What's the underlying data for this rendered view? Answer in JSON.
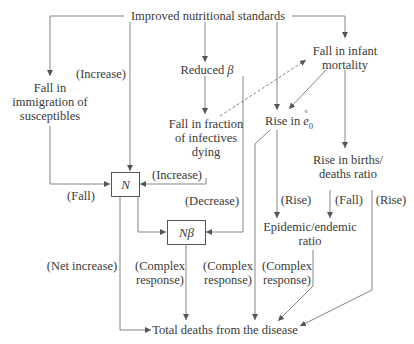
{
  "diagram": {
    "type": "flow-diagram",
    "root": "Improved nutritional standards",
    "nodes": {
      "improved_nutrition": "Improved nutritional standards",
      "fall_immigration": [
        "Fall in",
        "immigration of",
        "susceptibles"
      ],
      "reduced_beta": "Reduced β",
      "fall_infant_mortality": [
        "Fall in infant",
        "mortality"
      ],
      "fall_fraction_infectives": [
        "Fall in fraction",
        "of infectives",
        "dying"
      ],
      "rise_e0": "Rise in e̊₀",
      "rise_births_deaths": [
        "Rise in births/",
        "deaths ratio"
      ],
      "N": "N",
      "N_beta": "Nβ",
      "epidemic_endemic": [
        "Epidemic/endemic",
        "ratio"
      ],
      "total_deaths": "Total deaths from the disease"
    },
    "edge_labels": {
      "increase_to_N_top": "(Increase)",
      "fall_to_N": "(Fall)",
      "increase_to_N_right": "(Increase)",
      "decrease_to_Nbeta": "(Decrease)",
      "rise_to_epidemic": "(Rise)",
      "fall_to_epidemic": "(Fall)",
      "rise_to_total": "(Rise)",
      "net_increase": "(Net increase)",
      "complex_1": [
        "(Complex",
        "response)"
      ],
      "complex_2": [
        "(Complex",
        "response)"
      ],
      "complex_3": [
        "(Complex",
        "response)"
      ]
    },
    "edges": [
      {
        "from": "Improved nutritional standards",
        "to": "Fall in immigration of susceptibles"
      },
      {
        "from": "Improved nutritional standards",
        "to": "N",
        "label": "(Increase)"
      },
      {
        "from": "Improved nutritional standards",
        "to": "Reduced β"
      },
      {
        "from": "Improved nutritional standards",
        "to": "Rise in e̊₀"
      },
      {
        "from": "Improved nutritional standards",
        "to": "Fall in infant mortality"
      },
      {
        "from": "Reduced β",
        "to": "Fall in fraction of infectives dying"
      },
      {
        "from": "Fall in fraction of infectives dying",
        "to": "Fall in infant mortality",
        "style": "dashed"
      },
      {
        "from": "Fall in infant mortality",
        "to": "Rise in e̊₀"
      },
      {
        "from": "Fall in infant mortality",
        "to": "Rise in births/deaths ratio"
      },
      {
        "from": "Fall in immigration of susceptibles",
        "to": "N",
        "label": "(Fall)"
      },
      {
        "from": "Fall in fraction of infectives dying",
        "to": "N",
        "label": "(Increase)"
      },
      {
        "from": "Reduced β",
        "to": "Nβ",
        "label": "(Decrease)"
      },
      {
        "from": "N",
        "to": "Nβ"
      },
      {
        "from": "Rise in e̊₀",
        "to": "Epidemic/endemic ratio",
        "label": "(Rise)"
      },
      {
        "from": "Rise in births/deaths ratio",
        "to": "Epidemic/endemic ratio",
        "label": "(Fall)"
      },
      {
        "from": "N",
        "to": "Total deaths from the disease",
        "label": "(Net increase)"
      },
      {
        "from": "Nβ",
        "to": "Total deaths from the disease",
        "label": "(Complex response)"
      },
      {
        "from": "Rise in e̊₀",
        "to": "Total deaths from the disease",
        "label": "(Complex response)"
      },
      {
        "from": "Epidemic/endemic ratio",
        "to": "Total deaths from the disease",
        "label": "(Complex response)"
      },
      {
        "from": "Rise in births/deaths ratio",
        "to": "Total deaths from the disease",
        "label": "(Rise)"
      }
    ]
  },
  "labels": {
    "improved": "Improved nutritional standards",
    "fall_imm_1": "Fall in",
    "fall_imm_2": "immigration of",
    "fall_imm_3": "susceptibles",
    "reduced": "Reduced",
    "beta": "β",
    "infant_1": "Fall in infant",
    "infant_2": "mortality",
    "fraction_1": "Fall in fraction",
    "fraction_2": "of infectives",
    "fraction_3": "dying",
    "rise_in": "Rise in",
    "e0_symbol": "e",
    "e0_ring": "°",
    "e0_sub": "0",
    "births_1": "Rise in births/",
    "births_2": "deaths ratio",
    "N": "N",
    "Nbeta": "Nβ",
    "epi_1": "Epidemic/endemic",
    "epi_2": "ratio",
    "total": "Total deaths from the disease",
    "increase_top": "(Increase)",
    "fall_left": "(Fall)",
    "increase_right": "(Increase)",
    "decrease": "(Decrease)",
    "rise_a": "(Rise)",
    "fall_b": "(Fall)",
    "rise_c": "(Rise)",
    "net_increase": "(Net increase)",
    "complex_a1": "(Complex",
    "complex_a2": "response)",
    "complex_b1": "(Complex",
    "complex_b2": "response)",
    "complex_c1": "(Complex",
    "complex_c2": "response)"
  },
  "colors": {
    "line": "#666666",
    "text": "#3a3a3a",
    "background": "#ffffff"
  }
}
